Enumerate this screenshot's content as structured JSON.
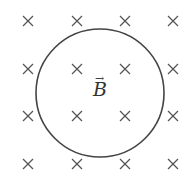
{
  "diagram": {
    "field_symbol": "B",
    "field_arrow": "→",
    "field_direction": "into-page",
    "cross_glyph": "×",
    "colors": {
      "stroke": "#444444",
      "cross": "#555555",
      "background": "#ffffff"
    },
    "circle": {
      "cx": 100,
      "cy": 93,
      "r": 64
    },
    "grid": {
      "xs": [
        28,
        77,
        125,
        173
      ],
      "ys": [
        21,
        69,
        116,
        164
      ]
    }
  }
}
